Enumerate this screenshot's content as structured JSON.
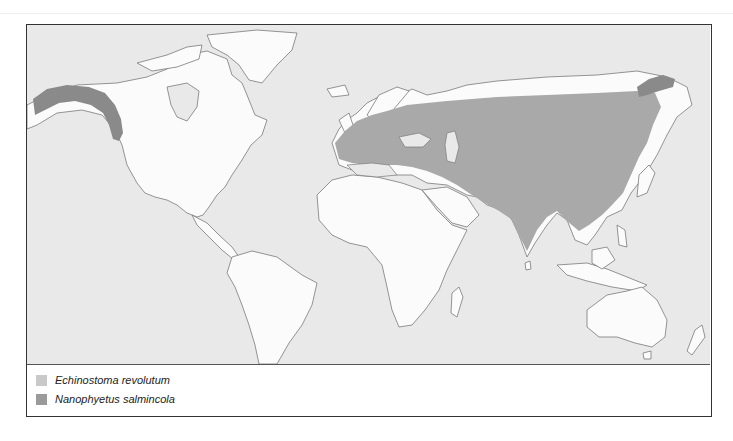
{
  "map": {
    "sea_color": "#e9e9e9",
    "land_color": "#fbfbfb",
    "coast_color": "#777777",
    "ranges": [
      {
        "species": "Echinostoma revolutum",
        "color": "#a9a9a9",
        "region": "Europe and Asia (Europe, Middle East, Central Asia, India, China, Southeast Asia)"
      },
      {
        "species": "Nanophyetus salmincola",
        "color": "#8a8a8a",
        "region": "Alaska to Pacific Northwest coast of North America; Kamchatka / eastern Siberia"
      }
    ]
  },
  "legend": {
    "items": [
      {
        "label": "Echinostoma revolutum",
        "color": "#c9c9c9"
      },
      {
        "label": "Nanophyetus salmincola",
        "color": "#9a9a9a"
      }
    ]
  }
}
